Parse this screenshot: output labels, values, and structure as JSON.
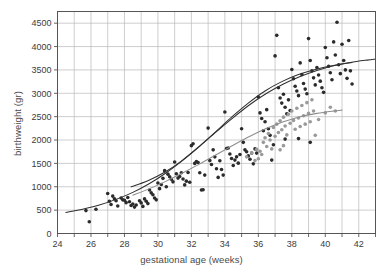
{
  "chart_data": {
    "type": "scatter",
    "title": "",
    "xlabel": "gestational age (weeks)",
    "ylabel": "birthweight (gr)",
    "xlim": [
      24,
      43
    ],
    "ylim": [
      0,
      4750
    ],
    "grid": true,
    "legend_position": "none",
    "xticks": [
      24,
      25,
      26,
      27,
      28,
      29,
      30,
      31,
      32,
      33,
      34,
      35,
      36,
      37,
      38,
      39,
      40,
      41,
      42,
      43
    ],
    "xtick_labels": [
      "24",
      "",
      "26",
      "",
      "28",
      "",
      "30",
      "",
      "32",
      "",
      "34",
      "",
      "36",
      "",
      "38",
      "",
      "40",
      "",
      "42",
      ""
    ],
    "yticks": [
      0,
      500,
      1000,
      1500,
      2000,
      2500,
      3000,
      3500,
      4000,
      4500
    ],
    "ytick_labels": [
      "0",
      "500",
      "1000",
      "1500",
      "2000",
      "2500",
      "3000",
      "3500",
      "4000",
      "4500"
    ],
    "colors": {
      "dark_points": "#2b2b2b",
      "light_points": "#9a9a9a",
      "dark_curve": "#303030",
      "light_curve": "#8d8d8d",
      "grid": "#b9b9b9",
      "frame": "#555555",
      "text": "#3c3c3c"
    },
    "series": [
      {
        "name": "dark-points",
        "marker": "filled-circle",
        "color": "#2b2b2b",
        "points": [
          [
            25.7,
            490
          ],
          [
            25.9,
            250
          ],
          [
            26.3,
            520
          ],
          [
            27.0,
            855
          ],
          [
            27.1,
            690
          ],
          [
            27.2,
            620
          ],
          [
            27.3,
            800
          ],
          [
            27.4,
            745
          ],
          [
            27.5,
            700
          ],
          [
            27.6,
            590
          ],
          [
            27.8,
            760
          ],
          [
            27.9,
            720
          ],
          [
            28.0,
            710
          ],
          [
            28.1,
            660
          ],
          [
            28.2,
            770
          ],
          [
            28.3,
            680
          ],
          [
            28.4,
            600
          ],
          [
            28.5,
            630
          ],
          [
            28.6,
            565
          ],
          [
            28.7,
            610
          ],
          [
            28.9,
            700
          ],
          [
            29.0,
            655
          ],
          [
            29.1,
            580
          ],
          [
            29.2,
            740
          ],
          [
            29.3,
            690
          ],
          [
            29.4,
            640
          ],
          [
            29.5,
            930
          ],
          [
            29.6,
            870
          ],
          [
            29.7,
            830
          ],
          [
            29.8,
            760
          ],
          [
            29.9,
            720
          ],
          [
            30.0,
            1080
          ],
          [
            30.1,
            960
          ],
          [
            30.2,
            1050
          ],
          [
            30.3,
            1180
          ],
          [
            30.4,
            1345
          ],
          [
            30.5,
            1000
          ],
          [
            30.6,
            1270
          ],
          [
            30.7,
            1215
          ],
          [
            30.8,
            1160
          ],
          [
            30.9,
            1105
          ],
          [
            31.0,
            1530
          ],
          [
            31.1,
            1280
          ],
          [
            31.2,
            1185
          ],
          [
            31.3,
            1220
          ],
          [
            31.4,
            1300
          ],
          [
            31.5,
            1165
          ],
          [
            31.6,
            1040
          ],
          [
            31.7,
            1120
          ],
          [
            31.8,
            1305
          ],
          [
            31.9,
            1095
          ],
          [
            32.0,
            1880
          ],
          [
            32.1,
            1920
          ],
          [
            32.2,
            1500
          ],
          [
            32.3,
            1540
          ],
          [
            32.4,
            1520
          ],
          [
            32.5,
            1300
          ],
          [
            32.6,
            930
          ],
          [
            32.7,
            935
          ],
          [
            32.8,
            1250
          ],
          [
            33.0,
            2255
          ],
          [
            33.1,
            1560
          ],
          [
            33.2,
            1475
          ],
          [
            33.3,
            1790
          ],
          [
            33.4,
            1640
          ],
          [
            33.5,
            1385
          ],
          [
            33.6,
            1200
          ],
          [
            33.7,
            1555
          ],
          [
            33.8,
            1370
          ],
          [
            33.9,
            1250
          ],
          [
            34.0,
            2600
          ],
          [
            34.1,
            1820
          ],
          [
            34.2,
            1830
          ],
          [
            34.3,
            1700
          ],
          [
            34.4,
            1605
          ],
          [
            34.5,
            1455
          ],
          [
            34.6,
            1570
          ],
          [
            34.7,
            1640
          ],
          [
            34.8,
            1505
          ],
          [
            34.9,
            1690
          ],
          [
            35.0,
            2240
          ],
          [
            35.1,
            1950
          ],
          [
            35.2,
            1790
          ],
          [
            35.3,
            1750
          ],
          [
            35.4,
            1660
          ],
          [
            35.5,
            1590
          ],
          [
            35.6,
            1720
          ],
          [
            35.7,
            1490
          ],
          [
            35.8,
            1810
          ],
          [
            35.9,
            1720
          ],
          [
            36.0,
            2920
          ],
          [
            36.1,
            2580
          ],
          [
            36.2,
            2460
          ],
          [
            36.3,
            2200
          ],
          [
            36.4,
            2390
          ],
          [
            36.5,
            2650
          ],
          [
            36.6,
            2240
          ],
          [
            36.7,
            2100
          ],
          [
            36.8,
            1570
          ],
          [
            36.9,
            1900
          ],
          [
            37.0,
            3800
          ],
          [
            37.1,
            4240
          ],
          [
            37.2,
            3120
          ],
          [
            37.3,
            2900
          ],
          [
            37.4,
            2790
          ],
          [
            37.5,
            2980
          ],
          [
            37.6,
            2700
          ],
          [
            37.7,
            2560
          ],
          [
            37.8,
            2860
          ],
          [
            37.9,
            2630
          ],
          [
            38.0,
            3510
          ],
          [
            38.1,
            3310
          ],
          [
            38.2,
            3150
          ],
          [
            38.3,
            3050
          ],
          [
            38.4,
            2950
          ],
          [
            38.5,
            3650
          ],
          [
            38.6,
            3400
          ],
          [
            38.7,
            3210
          ],
          [
            38.8,
            3090
          ],
          [
            38.9,
            2990
          ],
          [
            39.0,
            4170
          ],
          [
            39.1,
            3700
          ],
          [
            39.2,
            3480
          ],
          [
            39.3,
            3330
          ],
          [
            39.4,
            3180
          ],
          [
            39.5,
            3550
          ],
          [
            39.6,
            3390
          ],
          [
            39.7,
            3260
          ],
          [
            39.8,
            3120
          ],
          [
            39.9,
            3020
          ],
          [
            40.0,
            3980
          ],
          [
            40.1,
            3760
          ],
          [
            40.2,
            3580
          ],
          [
            40.3,
            3440
          ],
          [
            40.4,
            3290
          ],
          [
            40.5,
            4100
          ],
          [
            40.6,
            3820
          ],
          [
            40.7,
            4520
          ],
          [
            40.8,
            3610
          ],
          [
            40.9,
            3420
          ],
          [
            41.0,
            4050
          ],
          [
            41.1,
            3700
          ],
          [
            41.2,
            3500
          ],
          [
            41.3,
            3320
          ],
          [
            41.4,
            4130
          ],
          [
            41.5,
            3480
          ],
          [
            41.6,
            3200
          ],
          [
            39.1,
            1950
          ],
          [
            38.4,
            2030
          ],
          [
            37.6,
            2020
          ]
        ]
      },
      {
        "name": "light-points",
        "marker": "filled-circle",
        "color": "#9a9a9a",
        "points": [
          [
            35.3,
            1640
          ],
          [
            35.6,
            1720
          ],
          [
            35.9,
            1800
          ],
          [
            36.1,
            1760
          ],
          [
            36.3,
            1950
          ],
          [
            36.4,
            2050
          ],
          [
            36.5,
            1860
          ],
          [
            36.6,
            2140
          ],
          [
            36.7,
            2000
          ],
          [
            36.8,
            1810
          ],
          [
            36.9,
            2270
          ],
          [
            37.0,
            2080
          ],
          [
            37.1,
            2340
          ],
          [
            37.2,
            2160
          ],
          [
            37.3,
            2410
          ],
          [
            37.4,
            2220
          ],
          [
            37.5,
            2490
          ],
          [
            37.6,
            2300
          ],
          [
            37.7,
            2110
          ],
          [
            37.8,
            2550
          ],
          [
            37.9,
            2360
          ],
          [
            38.0,
            2620
          ],
          [
            38.1,
            2420
          ],
          [
            38.2,
            2230
          ],
          [
            38.3,
            2680
          ],
          [
            38.4,
            2470
          ],
          [
            38.5,
            2290
          ],
          [
            38.6,
            2740
          ],
          [
            38.7,
            2520
          ],
          [
            38.8,
            2340
          ],
          [
            38.9,
            2800
          ],
          [
            39.0,
            2570
          ],
          [
            39.1,
            2390
          ],
          [
            39.2,
            2860
          ],
          [
            39.3,
            2620
          ],
          [
            39.4,
            2100
          ],
          [
            39.6,
            2440
          ],
          [
            40.0,
            2580
          ],
          [
            40.3,
            2700
          ],
          [
            40.6,
            2620
          ],
          [
            36.2,
            1690
          ],
          [
            36.0,
            1600
          ],
          [
            35.8,
            1560
          ],
          [
            37.3,
            1790
          ],
          [
            37.5,
            1880
          ]
        ]
      }
    ],
    "curves": [
      {
        "name": "upper-fitted-curve",
        "style": "solid",
        "color": "#303030",
        "x_start": 24.5,
        "x_end": 43.0,
        "points": [
          [
            24.5,
            450
          ],
          [
            25.5,
            520
          ],
          [
            26.5,
            610
          ],
          [
            27.5,
            730
          ],
          [
            28.5,
            880
          ],
          [
            29.5,
            1070
          ],
          [
            30.5,
            1300
          ],
          [
            31.5,
            1570
          ],
          [
            32.5,
            1870
          ],
          [
            33.5,
            2180
          ],
          [
            34.5,
            2480
          ],
          [
            35.5,
            2760
          ],
          [
            36.5,
            3000
          ],
          [
            37.5,
            3200
          ],
          [
            38.5,
            3360
          ],
          [
            39.5,
            3490
          ],
          [
            40.5,
            3590
          ],
          [
            41.5,
            3660
          ],
          [
            42.5,
            3710
          ],
          [
            43.0,
            3730
          ]
        ]
      },
      {
        "name": "middle-fitted-curve",
        "style": "solid",
        "color": "#303030",
        "x_start": 28.4,
        "x_end": 41.6,
        "points": [
          [
            28.4,
            1000
          ],
          [
            29.4,
            1130
          ],
          [
            30.4,
            1310
          ],
          [
            31.4,
            1550
          ],
          [
            32.4,
            1840
          ],
          [
            33.4,
            2160
          ],
          [
            34.4,
            2490
          ],
          [
            35.4,
            2790
          ],
          [
            36.4,
            3050
          ],
          [
            37.4,
            3250
          ],
          [
            38.4,
            3400
          ],
          [
            39.4,
            3510
          ],
          [
            40.4,
            3590
          ],
          [
            41.6,
            3660
          ]
        ]
      },
      {
        "name": "lower-gray-curve",
        "style": "solid",
        "color": "#8d8d8d",
        "x_start": 28.5,
        "x_end": 41.0,
        "points": [
          [
            28.5,
            820
          ],
          [
            29.5,
            960
          ],
          [
            30.5,
            1120
          ],
          [
            31.5,
            1300
          ],
          [
            32.5,
            1490
          ],
          [
            33.5,
            1690
          ],
          [
            34.5,
            1890
          ],
          [
            35.5,
            2080
          ],
          [
            36.5,
            2250
          ],
          [
            37.5,
            2390
          ],
          [
            38.5,
            2500
          ],
          [
            39.5,
            2570
          ],
          [
            40.5,
            2620
          ],
          [
            41.0,
            2640
          ]
        ]
      }
    ]
  }
}
